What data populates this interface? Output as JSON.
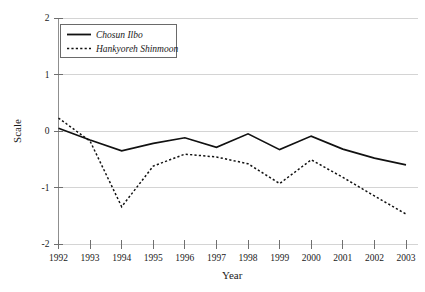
{
  "chart_data": {
    "type": "line",
    "title": "",
    "xlabel": "Year",
    "ylabel": "Scale",
    "x": [
      1992,
      1993,
      1994,
      1995,
      1996,
      1997,
      1998,
      1999,
      2000,
      2001,
      2002,
      2003
    ],
    "xtick_labels": [
      "1992",
      "1993",
      "1994",
      "1995",
      "1996",
      "1997",
      "1998",
      "1999",
      "2000",
      "2001",
      "2002",
      "2003"
    ],
    "ytick_labels": [
      "2",
      "1",
      "0",
      "-1",
      "-2"
    ],
    "yticks": [
      2,
      1,
      0,
      -1,
      -2
    ],
    "xlim": [
      1992,
      2003
    ],
    "ylim": [
      -2,
      2
    ],
    "grid": "horizontal",
    "legend_position": "upper-left-inside",
    "series": [
      {
        "name": "Chosun Ilbo",
        "style": "solid",
        "color": "#111111",
        "values": [
          0.05,
          -0.16,
          -0.35,
          -0.22,
          -0.12,
          -0.29,
          -0.05,
          -0.33,
          -0.09,
          -0.32,
          -0.48,
          -0.6
        ]
      },
      {
        "name": "Hankyoreh Shinmoon",
        "style": "dotted",
        "color": "#111111",
        "values": [
          0.23,
          -0.18,
          -1.34,
          -0.62,
          -0.41,
          -0.46,
          -0.58,
          -0.93,
          -0.51,
          -0.82,
          -1.15,
          -1.47
        ]
      }
    ]
  },
  "axis": {
    "y_label": "Scale",
    "x_label": "Year"
  },
  "colors": {
    "line": "#111111",
    "grid": "#cfcfcf",
    "axis": "#8f8f8f",
    "background": "#ffffff"
  }
}
